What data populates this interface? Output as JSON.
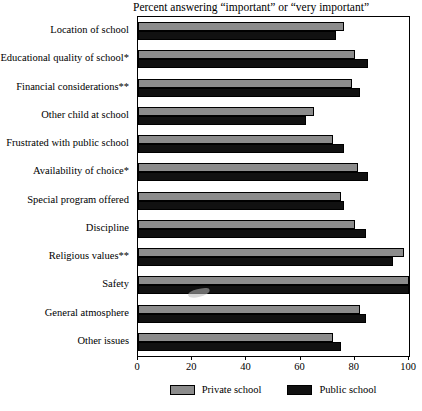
{
  "chart_data": {
    "type": "bar",
    "orientation": "horizontal",
    "title": "Percent answering “important” or “very important”",
    "xlabel": "",
    "ylabel": "",
    "xlim": [
      0,
      100
    ],
    "xticks": [
      0,
      20,
      40,
      60,
      80,
      100
    ],
    "grid": false,
    "legend_position": "bottom",
    "categories": [
      "Location of school",
      "Educational quality of school*",
      "Financial considerations**",
      "Other child at school",
      "Frustrated with public school",
      "Availability of choice*",
      "Special program offered",
      "Discipline",
      "Religious values**",
      "Safety",
      "General atmosphere",
      "Other issues"
    ],
    "series": [
      {
        "name": "Private school",
        "color": "#8c8c8c",
        "values": [
          76,
          80,
          79,
          65,
          72,
          81,
          75,
          80,
          98,
          100,
          82,
          72
        ]
      },
      {
        "name": "Public school",
        "color": "#111111",
        "values": [
          73,
          85,
          82,
          62,
          76,
          85,
          76,
          84,
          94,
          100,
          84,
          75
        ]
      }
    ]
  },
  "legend": {
    "items": [
      {
        "label": "Private school",
        "swatch": "private"
      },
      {
        "label": "Public school",
        "swatch": "public"
      }
    ]
  },
  "axis": {
    "tick_labels": [
      "0",
      "20",
      "40",
      "60",
      "80",
      "100"
    ]
  }
}
